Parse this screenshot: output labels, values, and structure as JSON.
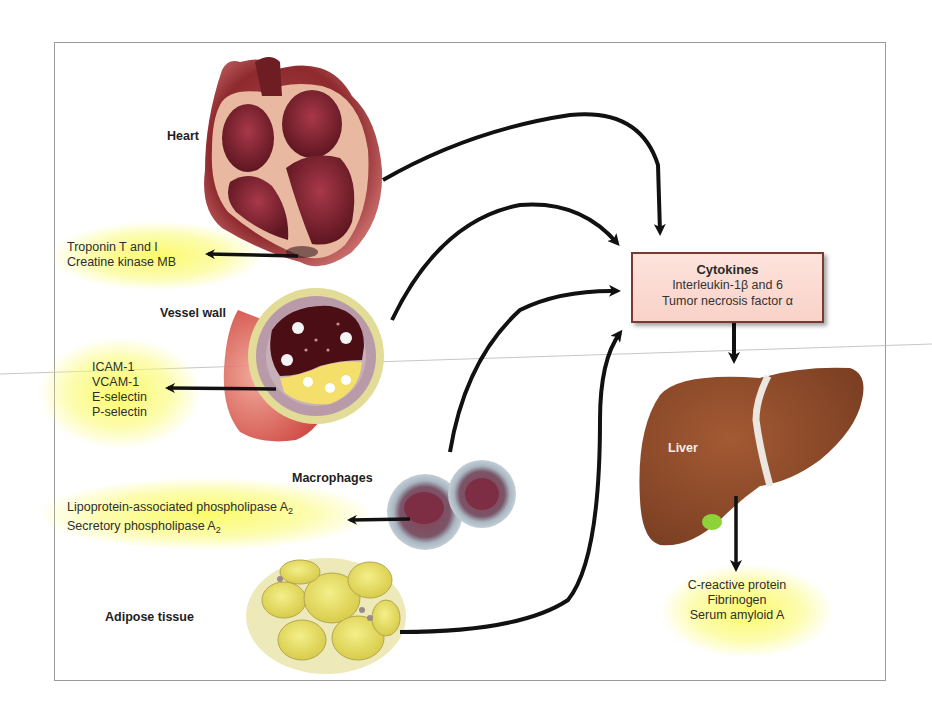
{
  "diagram": {
    "type": "biological pathway diagram",
    "colors": {
      "frame": "#9a9a9a",
      "highlight_glow": "#f7f55a",
      "cytokine_box_fill": "#fbd9d0",
      "cytokine_box_border": "#7a3a32",
      "arrow": "#111111",
      "liver": "#8a4a2a",
      "heart": "#8e2a2e",
      "adipose": "#e8e070",
      "macrophage": "#9fb0bd"
    },
    "sources": [
      {
        "id": "heart",
        "label": "Heart",
        "icon": "heart-cross-section-icon",
        "markers": [
          "Troponin T and I",
          "Creatine kinase MB"
        ]
      },
      {
        "id": "vessel",
        "label": "Vessel wall",
        "icon": "artery-plaque-cross-section-icon",
        "markers": [
          "ICAM-1",
          "VCAM-1",
          "E-selectin",
          "P-selectin"
        ]
      },
      {
        "id": "macrophages",
        "label": "Macrophages",
        "icon": "macrophage-cells-icon",
        "markers": [
          {
            "text": "Lipoprotein-associated phospholipase A",
            "sub": "2"
          },
          {
            "text": "Secretory phospholipase A",
            "sub": "2"
          }
        ]
      },
      {
        "id": "adipose",
        "label": "Adipose tissue",
        "icon": "adipocyte-cluster-icon",
        "markers": []
      }
    ],
    "hub": {
      "title": "Cytokines",
      "lines": [
        "Interleukin-1β and 6",
        "Tumor necrosis factor α"
      ]
    },
    "liver": {
      "label": "Liver",
      "icon": "liver-icon",
      "markers": [
        "C-reactive protein",
        "Fibrinogen",
        "Serum amyloid A"
      ]
    },
    "edges": [
      {
        "from": "heart",
        "to": "cytokines"
      },
      {
        "from": "vessel",
        "to": "cytokines"
      },
      {
        "from": "macrophages",
        "to": "cytokines"
      },
      {
        "from": "adipose",
        "to": "cytokines"
      },
      {
        "from": "cytokines",
        "to": "liver"
      },
      {
        "from": "heart",
        "to": "heart-markers"
      },
      {
        "from": "vessel",
        "to": "vessel-markers"
      },
      {
        "from": "macrophages",
        "to": "macrophage-markers"
      },
      {
        "from": "liver",
        "to": "liver-markers"
      }
    ]
  }
}
